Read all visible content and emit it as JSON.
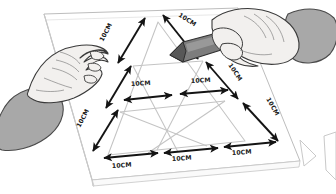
{
  "illustration": {
    "title": "Hand-drawn triangle subdivision with 10CM measurements",
    "background_color": "#ffffff",
    "ink_color": "#1a1a1a",
    "paper_color": "#ffffff",
    "paper_edge_color": "#b9b9b9",
    "grid_line_color": "#c9c9c9",
    "skin_color": "#f2f0ee",
    "skin_outline_color": "#3a3a3a",
    "sleeve_color": "#a8a8a8",
    "sleeve_outline_color": "#4a4a4a",
    "pencil_body_color": "#7d7d7d",
    "pencil_tip_color": "#585858",
    "pencil_highlight_color": "#b0b0b0"
  },
  "measurements": {
    "unit_label": "10CM",
    "labels": [
      {
        "id": "top-left-upper",
        "text": "10CM",
        "x": 103,
        "y": 42,
        "rotate": -62
      },
      {
        "id": "top-left-lower",
        "text": "10CM",
        "x": 92,
        "y": 88,
        "rotate": -62
      },
      {
        "id": "left-lower",
        "text": "10CM",
        "x": 80,
        "y": 128,
        "rotate": -62
      },
      {
        "id": "apex-right",
        "text": "10CM",
        "x": 178,
        "y": 16,
        "rotate": 33
      },
      {
        "id": "mid-left",
        "text": "10CM",
        "x": 131,
        "y": 86,
        "rotate": 0
      },
      {
        "id": "mid-right",
        "text": "10CM",
        "x": 191,
        "y": 83,
        "rotate": 0
      },
      {
        "id": "right-upper",
        "text": "10CM",
        "x": 228,
        "y": 65,
        "rotate": 56
      },
      {
        "id": "right-lower",
        "text": "10CM",
        "x": 266,
        "y": 99,
        "rotate": 60
      },
      {
        "id": "bottom-left",
        "text": "10CM",
        "x": 124,
        "y": 166,
        "rotate": -4
      },
      {
        "id": "bottom-center",
        "text": "10CM",
        "x": 182,
        "y": 159,
        "rotate": -4
      },
      {
        "id": "bottom-right",
        "text": "10CM",
        "x": 241,
        "y": 153,
        "rotate": -4
      }
    ]
  },
  "objects": {
    "paper_sheet": "paper-sheet",
    "triangle": "equilateral-triangle-grid",
    "left_hand": "left-hand-flat",
    "right_hand": "right-hand-holding-pencil",
    "pencil": "pencil",
    "corner_object": "partial-object-bottom-right"
  }
}
